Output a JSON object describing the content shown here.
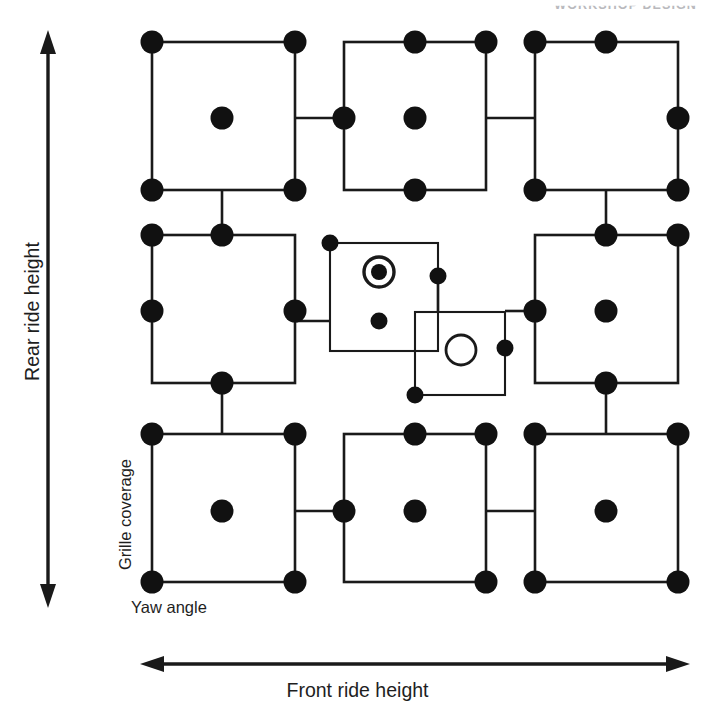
{
  "header": {
    "running_head": "WORKSHOP DESIGN"
  },
  "axes": {
    "y_label": "Rear ride height",
    "x_label": "Front ride height",
    "inner_y_label": "Grille coverage",
    "inner_x_label": "Yaw angle"
  },
  "colors": {
    "line": "#1a1a1a",
    "point_fill": "#111111",
    "background": "#ffffff",
    "header": "#b9b9bd"
  },
  "chart_data": {
    "type": "scatter",
    "title": "",
    "xlabel": "Front ride height",
    "ylabel": "Rear ride height",
    "inner_xlabel": "Yaw angle",
    "inner_ylabel": "Grille coverage",
    "xlim": [
      0,
      2
    ],
    "ylim": [
      0,
      2
    ],
    "grid": false,
    "legend": null,
    "point_styles": {
      "filled": "design point (run)",
      "bullseye": "centre point with replicate",
      "open": "centre point, unreplicated"
    },
    "blocks": [
      {
        "id": "top-left",
        "row": 0,
        "col": 0,
        "square": {
          "x": 152,
          "y": 42,
          "w": 143,
          "h": 148
        },
        "points": [
          {
            "pos": "top-left",
            "x": 152,
            "y": 42,
            "style": "filled"
          },
          {
            "pos": "top-right",
            "x": 295,
            "y": 42,
            "style": "filled"
          },
          {
            "pos": "bottom-left",
            "x": 152,
            "y": 190,
            "style": "filled"
          },
          {
            "pos": "bottom-right",
            "x": 295,
            "y": 190,
            "style": "filled"
          },
          {
            "pos": "centre",
            "x": 222,
            "y": 118,
            "style": "filled"
          }
        ]
      },
      {
        "id": "top-middle",
        "row": 0,
        "col": 1,
        "square": {
          "x": 344,
          "y": 42,
          "w": 142,
          "h": 148
        },
        "points": [
          {
            "pos": "top-middle",
            "x": 415,
            "y": 42,
            "style": "filled"
          },
          {
            "pos": "top-right",
            "x": 486,
            "y": 42,
            "style": "filled"
          },
          {
            "pos": "left-middle",
            "x": 344,
            "y": 118,
            "style": "filled"
          },
          {
            "pos": "bottom-middle",
            "x": 415,
            "y": 190,
            "style": "filled"
          },
          {
            "pos": "centre",
            "x": 415,
            "y": 118,
            "style": "filled"
          }
        ]
      },
      {
        "id": "top-right",
        "row": 0,
        "col": 2,
        "square": {
          "x": 535,
          "y": 42,
          "w": 143,
          "h": 148
        },
        "points": [
          {
            "pos": "top-left",
            "x": 535,
            "y": 42,
            "style": "filled"
          },
          {
            "pos": "top-middle",
            "x": 606,
            "y": 42,
            "style": "filled"
          },
          {
            "pos": "right-middle",
            "x": 678,
            "y": 118,
            "style": "filled"
          },
          {
            "pos": "bottom-left",
            "x": 535,
            "y": 190,
            "style": "filled"
          },
          {
            "pos": "bottom-right",
            "x": 678,
            "y": 190,
            "style": "filled"
          }
        ]
      },
      {
        "id": "middle-left",
        "row": 1,
        "col": 0,
        "square": {
          "x": 152,
          "y": 235,
          "w": 143,
          "h": 148
        },
        "points": [
          {
            "pos": "top-left",
            "x": 152,
            "y": 235,
            "style": "filled"
          },
          {
            "pos": "top-middle",
            "x": 222,
            "y": 235,
            "style": "filled"
          },
          {
            "pos": "left-middle",
            "x": 152,
            "y": 311,
            "style": "filled"
          },
          {
            "pos": "right-middle",
            "x": 295,
            "y": 311,
            "style": "filled"
          },
          {
            "pos": "bottom-middle",
            "x": 222,
            "y": 383,
            "style": "filled"
          }
        ]
      },
      {
        "id": "centre-upper",
        "row": 1,
        "col": 1,
        "square": {
          "x": 330,
          "y": 243,
          "w": 108,
          "h": 108
        },
        "nested": true,
        "points": [
          {
            "pos": "top-left",
            "x": 330,
            "y": 243,
            "style": "filled-small"
          },
          {
            "pos": "right-middle",
            "x": 438,
            "y": 276,
            "style": "filled-small"
          },
          {
            "pos": "bottom-middle",
            "x": 379,
            "y": 321,
            "style": "filled-small"
          },
          {
            "pos": "centre",
            "x": 379,
            "y": 272,
            "style": "bullseye"
          }
        ]
      },
      {
        "id": "centre-lower",
        "row": 1,
        "col": 1,
        "square": {
          "x": 415,
          "y": 312,
          "w": 90,
          "h": 83
        },
        "nested": true,
        "points": [
          {
            "pos": "right-middle",
            "x": 505,
            "y": 348,
            "style": "filled-small"
          },
          {
            "pos": "bottom-left",
            "x": 415,
            "y": 395,
            "style": "filled-small"
          },
          {
            "pos": "centre",
            "x": 461,
            "y": 350,
            "style": "open"
          }
        ]
      },
      {
        "id": "middle-right",
        "row": 1,
        "col": 2,
        "square": {
          "x": 535,
          "y": 235,
          "w": 143,
          "h": 148
        },
        "points": [
          {
            "pos": "top-middle",
            "x": 606,
            "y": 235,
            "style": "filled"
          },
          {
            "pos": "top-right",
            "x": 678,
            "y": 235,
            "style": "filled"
          },
          {
            "pos": "left-middle",
            "x": 535,
            "y": 311,
            "style": "filled"
          },
          {
            "pos": "centre",
            "x": 606,
            "y": 311,
            "style": "filled"
          },
          {
            "pos": "bottom-middle",
            "x": 606,
            "y": 383,
            "style": "filled"
          }
        ]
      },
      {
        "id": "bottom-left",
        "row": 2,
        "col": 0,
        "square": {
          "x": 152,
          "y": 434,
          "w": 143,
          "h": 148
        },
        "points": [
          {
            "pos": "top-left",
            "x": 152,
            "y": 434,
            "style": "filled"
          },
          {
            "pos": "top-right",
            "x": 295,
            "y": 434,
            "style": "filled"
          },
          {
            "pos": "bottom-left",
            "x": 152,
            "y": 582,
            "style": "filled"
          },
          {
            "pos": "bottom-right",
            "x": 295,
            "y": 582,
            "style": "filled"
          },
          {
            "pos": "centre",
            "x": 222,
            "y": 511,
            "style": "filled"
          }
        ]
      },
      {
        "id": "bottom-middle",
        "row": 2,
        "col": 1,
        "square": {
          "x": 344,
          "y": 434,
          "w": 142,
          "h": 148
        },
        "points": [
          {
            "pos": "top-middle",
            "x": 415,
            "y": 434,
            "style": "filled"
          },
          {
            "pos": "top-right",
            "x": 486,
            "y": 434,
            "style": "filled"
          },
          {
            "pos": "left-middle",
            "x": 344,
            "y": 511,
            "style": "filled"
          },
          {
            "pos": "centre",
            "x": 415,
            "y": 511,
            "style": "filled"
          },
          {
            "pos": "bottom-right",
            "x": 486,
            "y": 582,
            "style": "filled"
          }
        ]
      },
      {
        "id": "bottom-right",
        "row": 2,
        "col": 2,
        "square": {
          "x": 535,
          "y": 434,
          "w": 143,
          "h": 148
        },
        "points": [
          {
            "pos": "top-left",
            "x": 535,
            "y": 434,
            "style": "filled"
          },
          {
            "pos": "top-right",
            "x": 678,
            "y": 434,
            "style": "filled"
          },
          {
            "pos": "bottom-left",
            "x": 535,
            "y": 582,
            "style": "filled"
          },
          {
            "pos": "bottom-right",
            "x": 678,
            "y": 582,
            "style": "filled"
          },
          {
            "pos": "centre",
            "x": 606,
            "y": 511,
            "style": "filled"
          }
        ]
      }
    ],
    "connectors": [
      {
        "from": "top-left",
        "to": "top-middle",
        "x1": 295,
        "y1": 118,
        "x2": 344,
        "y2": 118
      },
      {
        "from": "top-middle",
        "to": "top-right",
        "x1": 486,
        "y1": 118,
        "x2": 535,
        "y2": 118
      },
      {
        "from": "middle-left",
        "to": "centre-upper",
        "x1": 295,
        "y1": 321,
        "x2": 330,
        "y2": 321
      },
      {
        "from": "centre-lower",
        "to": "middle-right",
        "x1": 505,
        "y1": 311,
        "x2": 535,
        "y2": 311
      },
      {
        "from": "bottom-left",
        "to": "bottom-middle",
        "x1": 295,
        "y1": 511,
        "x2": 344,
        "y2": 511
      },
      {
        "from": "bottom-middle",
        "to": "bottom-right",
        "x1": 486,
        "y1": 511,
        "x2": 535,
        "y2": 511
      },
      {
        "from": "top-left",
        "to": "middle-left",
        "x1": 222,
        "y1": 190,
        "x2": 222,
        "y2": 235
      },
      {
        "from": "top-right",
        "to": "middle-right",
        "x1": 606,
        "y1": 190,
        "x2": 606,
        "y2": 235
      },
      {
        "from": "middle-left",
        "to": "bottom-left",
        "x1": 222,
        "y1": 383,
        "x2": 222,
        "y2": 434
      },
      {
        "from": "middle-right",
        "to": "bottom-right",
        "x1": 606,
        "y1": 383,
        "x2": 606,
        "y2": 434
      },
      {
        "from": "centre-upper",
        "to": "centre-lower",
        "x1": 438,
        "y1": 312,
        "x2": 438,
        "y2": 276
      }
    ]
  }
}
